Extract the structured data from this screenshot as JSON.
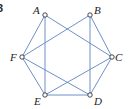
{
  "figure": {
    "number_label": "3",
    "edge_color": "#6f90c8",
    "vertices": [
      {
        "id": "A",
        "label": "A",
        "x": 45,
        "y": 15,
        "lx": 33,
        "ly": 14
      },
      {
        "id": "B",
        "label": "B",
        "x": 90,
        "y": 15,
        "lx": 94,
        "ly": 14
      },
      {
        "id": "C",
        "label": "C",
        "x": 112,
        "y": 57,
        "lx": 115,
        "ly": 61
      },
      {
        "id": "D",
        "label": "D",
        "x": 90,
        "y": 95,
        "lx": 94,
        "ly": 105
      },
      {
        "id": "E",
        "label": "E",
        "x": 45,
        "y": 95,
        "lx": 34,
        "ly": 105
      },
      {
        "id": "F",
        "label": "F",
        "x": 22,
        "y": 57,
        "lx": 10,
        "ly": 61
      }
    ],
    "edges": [
      [
        "A",
        "F"
      ],
      [
        "A",
        "E"
      ],
      [
        "A",
        "C"
      ],
      [
        "B",
        "F"
      ],
      [
        "B",
        "D"
      ],
      [
        "B",
        "C"
      ],
      [
        "F",
        "E"
      ],
      [
        "F",
        "D"
      ],
      [
        "C",
        "E"
      ],
      [
        "C",
        "D"
      ],
      [
        "E",
        "D"
      ]
    ]
  }
}
